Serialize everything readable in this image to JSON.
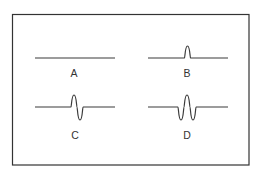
{
  "diagram": {
    "frame": {
      "x": 12.5,
      "y": 14.5,
      "width": 236.5,
      "height": 150.5,
      "stroke": "#333333"
    },
    "line_color": "#3a3a3a",
    "panels": [
      {
        "id": "A",
        "label": "A",
        "description": "flat line, no pulse",
        "baseline_y": 58,
        "x_start": 35,
        "x_end": 115,
        "label_pos": [
          74,
          77
        ],
        "path": "M35,58 L115,58"
      },
      {
        "id": "B",
        "label": "B",
        "description": "flat line with a single positive narrow pulse",
        "baseline_y": 58,
        "x_start": 148,
        "x_end": 228,
        "label_pos": [
          187,
          77
        ],
        "path": "M148,58 L184.5,58 C185,58 185,46 187.5,46 C190,46 190,58 190.5,58 L228,58"
      },
      {
        "id": "C",
        "label": "C",
        "description": "flat line with a positive lobe followed by a negative lobe (single cycle)",
        "baseline_y": 107,
        "x_start": 35,
        "x_end": 115,
        "label_pos": [
          75,
          139
        ],
        "path": "M35,107 L71,107 C71.5,107 71.5,95 74,95 C76.5,95 76.5,107 77,107 C77.5,107 77.5,120 80,120 C82.5,120 82.5,107 83,107 L115,107"
      },
      {
        "id": "D",
        "label": "D",
        "description": "flat line with negative, positive, negative lobes (symmetric wavelet)",
        "baseline_y": 107,
        "x_start": 148,
        "x_end": 228,
        "label_pos": [
          187,
          139
        ],
        "path": "M148,107 L178,107 C178.5,107 178.5,120 181,120 C183.5,120 183.5,107 184,107 C184.5,107 184.5,95 187,95 C189.5,95 189.5,107 190,107 C190.5,107 190.5,120 193,120 C195.5,120 195.5,107 196,107 L228,107"
      }
    ]
  }
}
